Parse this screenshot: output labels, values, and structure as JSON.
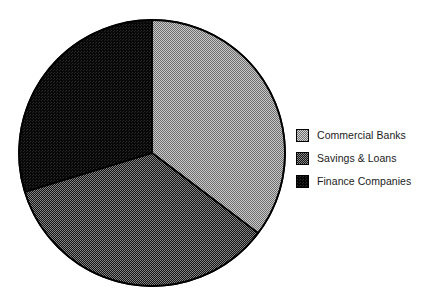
{
  "chart_data": {
    "type": "pie",
    "title": "",
    "subtitle": "",
    "xlabel": "",
    "ylabel": "",
    "grid": false,
    "legend_position": "right",
    "start_angle_deg": 0,
    "direction": "clockwise",
    "categories": [
      "Commercial Banks",
      "Savings & Loans",
      "Finance Companies"
    ],
    "values": [
      35,
      35,
      30
    ],
    "units": "percent",
    "slices": [
      {
        "label": "Commercial Banks",
        "value": 35,
        "start_deg": 0,
        "end_deg": 127,
        "fill": "#a8a8a8",
        "pattern": "checker-light",
        "edge": "#000000"
      },
      {
        "label": "Savings & Loans",
        "value": 35,
        "start_deg": 127,
        "end_deg": 253,
        "fill": "#4a4a4a",
        "pattern": "checker-dark",
        "edge": "#000000"
      },
      {
        "label": "Finance Companies",
        "value": 30,
        "start_deg": 253,
        "end_deg": 360,
        "fill": "#0d0d0d",
        "pattern": "solid-black",
        "edge": "#000000"
      }
    ],
    "geometry": {
      "center_x": 152,
      "center_y": 153,
      "radius": 133
    }
  },
  "legend": {
    "items": [
      {
        "label": "Commercial Banks",
        "swatch": "#a8a8a8"
      },
      {
        "label": "Savings & Loans",
        "swatch": "#4a4a4a"
      },
      {
        "label": "Finance Companies",
        "swatch": "#0d0d0d"
      }
    ]
  },
  "colors": {
    "background": "#ffffff",
    "outline": "#000000",
    "text": "#1b1b1b",
    "slice_light": "#a8a8a8",
    "slice_medium": "#4a4a4a",
    "slice_dark": "#0d0d0d"
  }
}
